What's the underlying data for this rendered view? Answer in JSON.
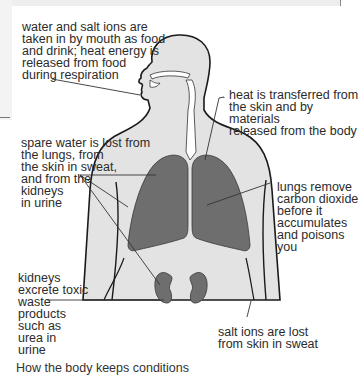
{
  "diagram": {
    "colors": {
      "body_fill": "#e3e3e3",
      "organ_fill": "#6e6e6e",
      "outline": "#1a1a1a",
      "leader_line": "#333333"
    },
    "labels": {
      "mouth": "water and salt ions are\ntaken in by mouth as food\nand drink; heat energy is\nreleased from food\nduring respiration",
      "skin_heat": "heat is transferred from\nthe skin and by materials\nreleased from the body",
      "water_loss": "spare water is lost from\nthe lungs, from\nthe skin in sweat,\nand from the\nkidneys\nin urine",
      "lungs": "lungs remove\ncarbon dioxide\nbefore it\naccumulates\nand poisons\nyou",
      "kidneys": "kidneys\nexcrete toxic\nwaste\nproducts\nsuch as\nurea in\nurine",
      "salt": "salt ions are lost\nfrom skin in sweat"
    },
    "caption_partial": "How the body keeps conditions"
  }
}
